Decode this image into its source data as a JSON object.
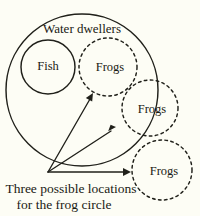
{
  "figure": {
    "kind": "venn-diagram",
    "background_color": "#fdfdf5",
    "stroke_color": "#20201a",
    "universe": {
      "label": "Water dwellers",
      "style": "solid",
      "center": [
        82,
        90
      ],
      "radius": 76,
      "label_position": [
        82,
        30
      ]
    },
    "subsets": [
      {
        "label": "Fish",
        "style": "solid",
        "center": [
          48,
          67
        ],
        "radius": 27,
        "inside_universe": true
      },
      {
        "label": "Frogs",
        "style": "dashed",
        "center": [
          108,
          67
        ],
        "radius": 29,
        "position_name": "inside",
        "inside_universe": true
      },
      {
        "label": "Frogs",
        "style": "dashed",
        "center": [
          150,
          108
        ],
        "radius": 28,
        "position_name": "overlapping",
        "inside_universe": false
      },
      {
        "label": "Frogs",
        "style": "dashed",
        "center": [
          162,
          170
        ],
        "radius": 30,
        "position_name": "outside",
        "inside_universe": false
      }
    ],
    "pointers": {
      "origin": [
        48,
        172
      ],
      "targets": [
        [
          93,
          95
        ],
        [
          115,
          128
        ],
        [
          130,
          172
        ]
      ]
    },
    "caption": {
      "line1": "Three possible locations",
      "line2": "for the frog circle"
    }
  }
}
